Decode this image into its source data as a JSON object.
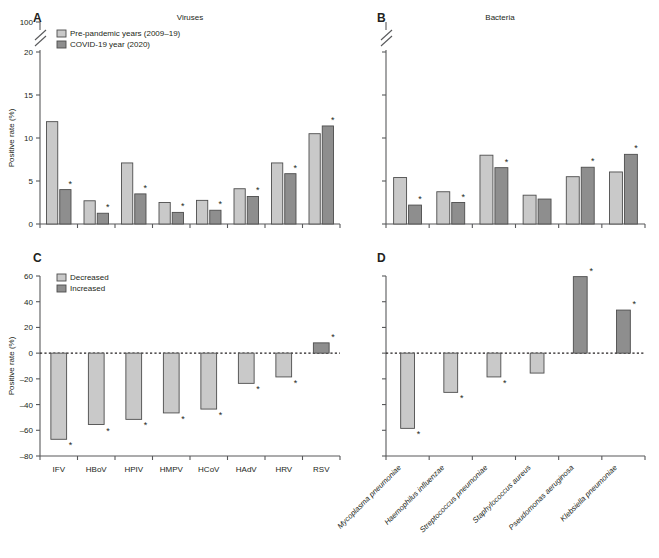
{
  "figure": {
    "colors": {
      "light": "#c9c9c9",
      "dark": "#8e8e8e",
      "stroke": "#4d4d4d",
      "axis": "#58595b",
      "text": "#231f20"
    },
    "star_symbol": "*"
  },
  "panels": {
    "a": {
      "letter": "A",
      "title": "Viruses",
      "axis_title": "Positive rate (%)",
      "legend": [
        {
          "label": "Pre-pandemic years (2009–19)",
          "color_key": "light"
        },
        {
          "label": "COVID-19 year (2020)",
          "color_key": "dark"
        }
      ],
      "y_ticks": [
        "0",
        "5",
        "10",
        "15",
        "20",
        "100"
      ],
      "axis_break": true
    },
    "b": {
      "letter": "B",
      "title": "Bacteria",
      "y_ticks": [],
      "axis_break": true
    },
    "c": {
      "letter": "C",
      "axis_title": "Positive rate (%)",
      "legend": [
        {
          "label": "Decreased",
          "color_key": "light"
        },
        {
          "label": "Increased",
          "color_key": "dark"
        }
      ],
      "y_ticks": [
        "-80",
        "-60",
        "-40",
        "-20",
        "0",
        "20",
        "40",
        "60"
      ]
    },
    "d": {
      "letter": "D",
      "y_ticks": []
    }
  },
  "chart_data": [
    {
      "id": "panel-a",
      "type": "bar",
      "title": "Viruses",
      "xlabel": "",
      "ylabel": "Positive rate (%)",
      "ylim": [
        0,
        20
      ],
      "y_ticks": [
        0,
        5,
        10,
        15,
        20
      ],
      "y_broken_top_tick": 100,
      "grid": false,
      "legend_position": "top-left",
      "categories": [
        "IFV",
        "HBoV",
        "HPIV",
        "HMPV",
        "HCoV",
        "HAdV",
        "HRV",
        "RSV"
      ],
      "series": [
        {
          "name": "Pre-pandemic years (2009–19)",
          "color": "#c9c9c9",
          "values": [
            11.9,
            2.7,
            7.1,
            2.5,
            2.75,
            4.1,
            7.1,
            10.5
          ]
        },
        {
          "name": "COVID-19 year (2020)",
          "color": "#8e8e8e",
          "values": [
            4.0,
            1.25,
            3.5,
            1.35,
            1.6,
            3.2,
            5.85,
            11.4
          ]
        }
      ],
      "significance": {
        "series": "COVID-19 year (2020)",
        "marked_categories": [
          "IFV",
          "HBoV",
          "HPIV",
          "HMPV",
          "HCoV",
          "HAdV",
          "HRV",
          "RSV"
        ],
        "symbol": "*"
      }
    },
    {
      "id": "panel-b",
      "type": "bar",
      "title": "Bacteria",
      "xlabel": "",
      "ylabel": "",
      "ylim": [
        0,
        20
      ],
      "y_ticks": [
        0,
        5,
        10,
        15,
        20
      ],
      "y_broken_top_tick": 100,
      "grid": false,
      "legend_position": "none",
      "categories": [
        "Mycoplasma pneumoniae",
        "Haemophilus influenzae",
        "Streptococcus pneumoniae",
        "Staphylococcus aureus",
        "Pseudomonas aeruginosa",
        "Klebsiella pneumoniae"
      ],
      "series": [
        {
          "name": "Pre-pandemic years (2009–19)",
          "color": "#c9c9c9",
          "values": [
            5.4,
            3.75,
            8.0,
            3.35,
            5.5,
            6.05
          ]
        },
        {
          "name": "COVID-19 year (2020)",
          "color": "#8e8e8e",
          "values": [
            2.2,
            2.5,
            6.55,
            2.9,
            6.6,
            8.1
          ]
        }
      ],
      "significance": {
        "series": "COVID-19 year (2020)",
        "marked_categories": [
          "Mycoplasma pneumoniae",
          "Haemophilus influenzae",
          "Streptococcus pneumoniae",
          "Pseudomonas aeruginosa",
          "Klebsiella pneumoniae"
        ],
        "symbol": "*"
      }
    },
    {
      "id": "panel-c",
      "type": "bar",
      "title": "",
      "xlabel": "",
      "ylabel": "Positive rate (%)",
      "ylim": [
        -80,
        60
      ],
      "y_ticks": [
        -80,
        -60,
        -40,
        -20,
        0,
        20,
        40,
        60
      ],
      "grid": false,
      "legend_position": "top-left",
      "legend_entries": [
        "Decreased",
        "Increased"
      ],
      "categories": [
        "IFV",
        "HBoV",
        "HPIV",
        "HMPV",
        "HCoV",
        "HAdV",
        "HRV",
        "RSV"
      ],
      "values": [
        -67.0,
        -55.5,
        -51.5,
        -46.5,
        -43.5,
        -23.5,
        -18.5,
        8.0
      ],
      "bar_colors": [
        "#c9c9c9",
        "#c9c9c9",
        "#c9c9c9",
        "#c9c9c9",
        "#c9c9c9",
        "#c9c9c9",
        "#c9c9c9",
        "#8e8e8e"
      ],
      "significance": {
        "marked_categories": [
          "IFV",
          "HBoV",
          "HPIV",
          "HMPV",
          "HCoV",
          "HAdV",
          "HRV",
          "RSV"
        ],
        "symbol": "*"
      }
    },
    {
      "id": "panel-d",
      "type": "bar",
      "title": "",
      "xlabel": "",
      "ylabel": "",
      "ylim": [
        -80,
        60
      ],
      "y_ticks": [
        -80,
        -60,
        -40,
        -20,
        0,
        20,
        40,
        60
      ],
      "grid": false,
      "legend_position": "none",
      "categories": [
        "Mycoplasma pneumoniae",
        "Haemophilus influenzae",
        "Streptococcus pneumoniae",
        "Staphylococcus aureus",
        "Pseudomonas aeruginosa",
        "Klebsiella pneumoniae"
      ],
      "values": [
        -58.5,
        -30.5,
        -18.5,
        -15.5,
        59.5,
        33.5
      ],
      "bar_colors": [
        "#c9c9c9",
        "#c9c9c9",
        "#c9c9c9",
        "#c9c9c9",
        "#8e8e8e",
        "#8e8e8e"
      ],
      "significance": {
        "marked_categories": [
          "Mycoplasma pneumoniae",
          "Haemophilus influenzae",
          "Streptococcus pneumoniae",
          "Pseudomonas aeruginosa",
          "Klebsiella pneumoniae"
        ],
        "symbol": "*"
      }
    }
  ]
}
